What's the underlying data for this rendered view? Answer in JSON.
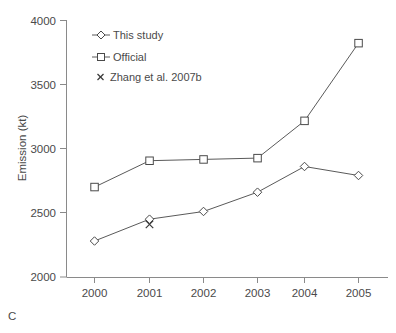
{
  "panel": {
    "label": "C"
  },
  "chart_data": {
    "type": "line",
    "title": "",
    "xlabel": "",
    "ylabel": "Emission (kt)",
    "categories": [
      "2000",
      "2001",
      "2002",
      "2003",
      "2004",
      "2005"
    ],
    "x": [
      2000,
      2001,
      2002,
      2003,
      2004,
      2005
    ],
    "ylim": [
      2000,
      4000
    ],
    "yticks": [
      2000,
      2500,
      3000,
      3500,
      4000
    ],
    "ytick_labels": [
      "2000",
      "2500",
      "3000",
      "3500",
      "4000"
    ],
    "xtick_labels": [
      "2000",
      "2001",
      "2002",
      "2003",
      "2004",
      "2005"
    ],
    "grid": false,
    "legend_position": "top-left",
    "series": [
      {
        "name": "This study",
        "marker": "diamond",
        "values": [
          2280,
          2450,
          2510,
          2660,
          2860,
          2790
        ]
      },
      {
        "name": "Official",
        "marker": "square",
        "values": [
          2700,
          2905,
          2915,
          2925,
          3215,
          3820
        ]
      },
      {
        "name": "Zhang et al. 2007b",
        "marker": "x",
        "values": [
          null,
          2410,
          null,
          null,
          null,
          null
        ]
      }
    ],
    "legend": [
      {
        "label": "This study",
        "marker": "diamond"
      },
      {
        "label": "Official",
        "marker": "square"
      },
      {
        "label": "Zhang et al. 2007b",
        "marker": "x"
      }
    ],
    "colors": {
      "line": "#5a5a5a",
      "marker_fill": "#ffffff",
      "marker_stroke": "#4a4a4a",
      "axis": "#8a8a8a",
      "text": "#4a4a4a",
      "background": "#ffffff"
    }
  }
}
